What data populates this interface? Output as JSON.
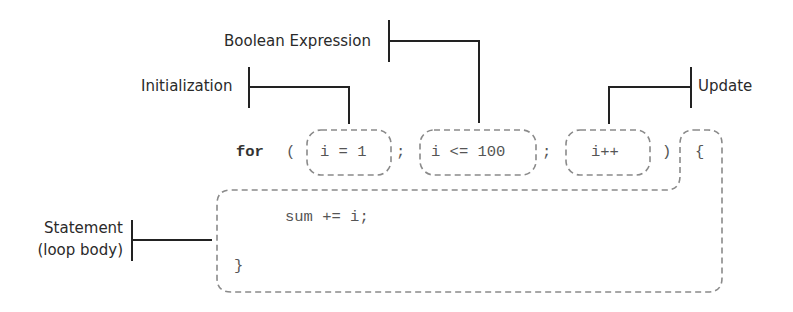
{
  "diagram": {
    "labels": {
      "initialization": "Initialization",
      "boolean_expression": "Boolean Expression",
      "update": "Update",
      "statement_line1": "Statement",
      "statement_line2": "(loop body)"
    },
    "code": {
      "keyword": "for",
      "open_paren": "(",
      "init": "i = 1",
      "sep1": ";",
      "condition": "i <= 100",
      "sep2": ";",
      "update": "i++",
      "close_paren": ")",
      "open_brace": "{",
      "body": "sum += i;",
      "close_brace": "}"
    },
    "colors": {
      "bracket_line": "#222222",
      "dashed_outline": "#8a8a8a",
      "label_text": "#2a2a2a",
      "code_text": "#555555"
    }
  }
}
